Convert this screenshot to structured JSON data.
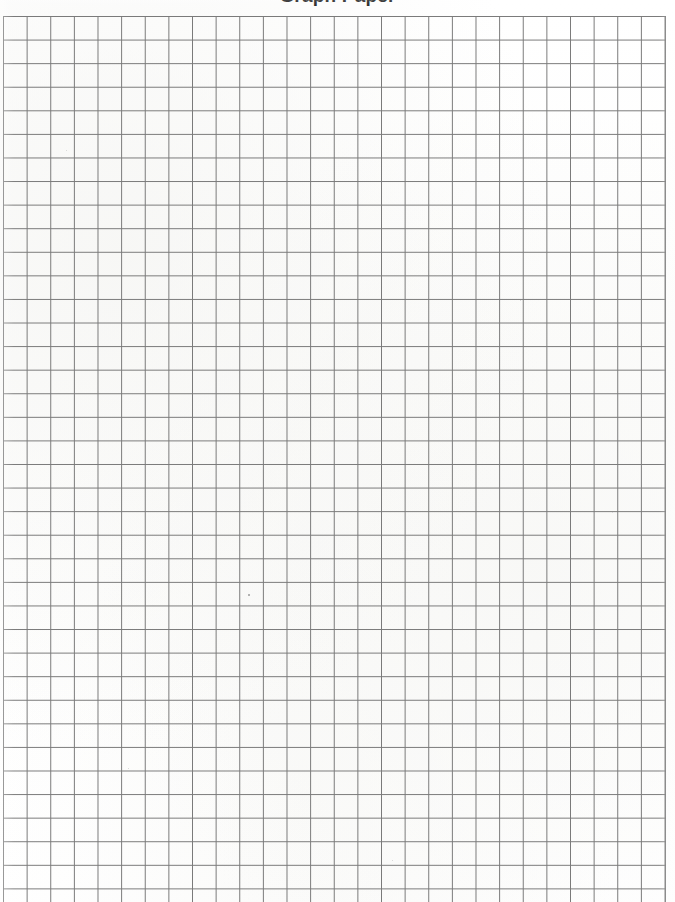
{
  "document": {
    "kind": "graph-paper-worksheet",
    "title_partially_cut_off": "Graph Paper",
    "paper_color": "#ffffff",
    "page_width_px": 675,
    "page_height_px": 902
  },
  "grid": {
    "label": "Graph paper grid",
    "line_color": "#6f6f6f",
    "line_width_px": 1,
    "cell_width_px": 23.64,
    "cell_height_px": 23.58,
    "columns": 28,
    "rows": 38,
    "origin_x_px": 3,
    "origin_y_px": 16,
    "width_px": 663,
    "height_px": 895,
    "bottom_edge_cropped": true,
    "cells_are_blank": true
  },
  "chart_data": {
    "type": "table",
    "title": "Graph Paper",
    "xlabel": "",
    "ylabel": "",
    "categories": [],
    "values": [],
    "grid": true,
    "legend": "none",
    "columns": 28,
    "rows": 38,
    "note": "Blank square-ruled graph paper; no plotted data points, labels, or tick values are printed on the sheet."
  }
}
